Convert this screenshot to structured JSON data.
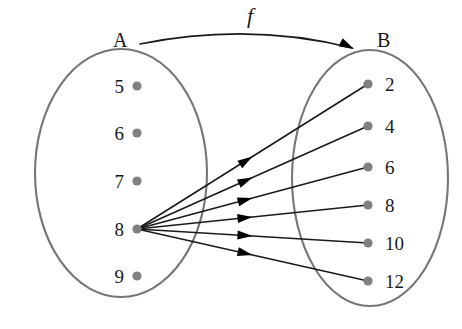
{
  "figure": {
    "type": "function-mapping-diagram",
    "function_name": "f",
    "background_color": "#ffffff",
    "outline_color": "#767676",
    "dot_color": "#808080",
    "arrow_color": "#1a1a1a"
  },
  "domain_set": {
    "label": "A",
    "label_x": 113,
    "label_y": 30,
    "ellipse": {
      "cx": 121,
      "cy": 173,
      "rx": 86,
      "ry": 124
    },
    "dot_x": 137,
    "label_offset_x": 124,
    "elements": [
      {
        "value": "5",
        "y": 86
      },
      {
        "value": "6",
        "y": 133
      },
      {
        "value": "7",
        "y": 181
      },
      {
        "value": "8",
        "y": 229
      },
      {
        "value": "9",
        "y": 276
      }
    ]
  },
  "codomain_set": {
    "label": "B",
    "label_x": 377,
    "label_y": 30,
    "ellipse": {
      "cx": 370,
      "cy": 178,
      "rx": 78,
      "ry": 128
    },
    "dot_x": 368,
    "label_offset_x": 385,
    "elements": [
      {
        "value": "2",
        "y": 84
      },
      {
        "value": "4",
        "y": 126
      },
      {
        "value": "6",
        "y": 167
      },
      {
        "value": "8",
        "y": 205
      },
      {
        "value": "10",
        "y": 243
      },
      {
        "value": "12",
        "y": 281
      }
    ]
  },
  "function_arrow": {
    "label": "f",
    "label_x": 250,
    "label_y": 16,
    "path": "M 140 44 Q 250 22 352 48",
    "head": {
      "x": 354,
      "y": 49,
      "angle": 27
    }
  },
  "mappings": [
    {
      "from": "8",
      "to": "2",
      "x1": 137,
      "y1": 229,
      "x2": 368,
      "y2": 84,
      "head_t": 0.5
    },
    {
      "from": "8",
      "to": "4",
      "x1": 137,
      "y1": 229,
      "x2": 368,
      "y2": 126,
      "head_t": 0.5
    },
    {
      "from": "8",
      "to": "6",
      "x1": 137,
      "y1": 229,
      "x2": 368,
      "y2": 167,
      "head_t": 0.5
    },
    {
      "from": "8",
      "to": "8",
      "x1": 137,
      "y1": 229,
      "x2": 368,
      "y2": 205,
      "head_t": 0.5
    },
    {
      "from": "8",
      "to": "10",
      "x1": 137,
      "y1": 229,
      "x2": 368,
      "y2": 243,
      "head_t": 0.5
    },
    {
      "from": "8",
      "to": "12",
      "x1": 137,
      "y1": 229,
      "x2": 368,
      "y2": 281,
      "head_t": 0.5
    }
  ]
}
